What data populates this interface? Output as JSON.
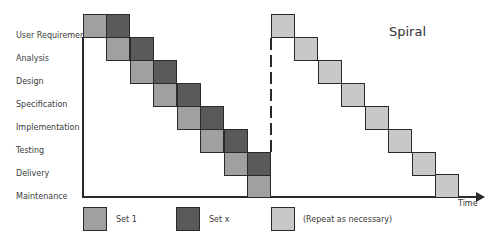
{
  "diagram": {
    "title": "Spiral",
    "x_axis_label": "Time",
    "phases": [
      "User Requirements",
      "Analysis",
      "Design",
      "Specification",
      "Implementation",
      "Testing",
      "Delivery",
      "Maintenance"
    ],
    "colors": {
      "set1": "#a0a0a0",
      "setx": "#5a5a5a",
      "repeat": "#c8c8c8"
    },
    "legend": [
      {
        "label": "Set 1",
        "color": "#a0a0a0"
      },
      {
        "label": "Set x",
        "color": "#5a5a5a"
      },
      {
        "label": "(Repeat as necessary)",
        "color": "#c8c8c8"
      }
    ]
  }
}
